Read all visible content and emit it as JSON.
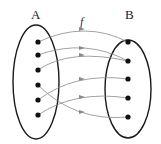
{
  "diagram": {
    "function_label": "f",
    "sets": [
      {
        "id": "A",
        "label": "A",
        "elements": 6
      },
      {
        "id": "B",
        "label": "B",
        "elements": 5
      }
    ],
    "mappings": [
      {
        "from": "A1",
        "to": "B1"
      },
      {
        "from": "A2",
        "to": "B2"
      },
      {
        "from": "A3",
        "to": "B2"
      },
      {
        "from": "A4",
        "to": "B5"
      },
      {
        "from": "A5",
        "to": "B3"
      },
      {
        "from": "A6",
        "to": "B4"
      }
    ],
    "colors": {
      "ellipse": "#1a1a1a",
      "dot": "#111111",
      "arrow": "#8a8a8a"
    }
  }
}
